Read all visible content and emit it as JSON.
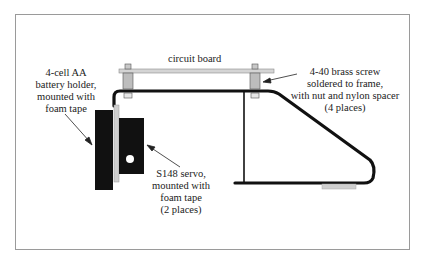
{
  "diagram": {
    "labels": {
      "circuit_board": "circuit board",
      "battery_holder": [
        "4-cell AA",
        "battery holder,",
        "mounted with",
        "foam tape"
      ],
      "brass_screw": [
        "4-40 brass screw",
        "soldered to frame,",
        "with nut and nylon spacer",
        "(4 places)"
      ],
      "servo": [
        "S148 servo,",
        "mounted with",
        "foam tape",
        "(2 places)"
      ]
    },
    "colors": {
      "frame_wire": "#111111",
      "circuit_board": "#c8c8c8",
      "spacer": "#bdbdbd",
      "battery": "#111111",
      "servo": "#111111",
      "foam_tape": "#c8c8c8",
      "border": "#9a9a9a"
    }
  }
}
